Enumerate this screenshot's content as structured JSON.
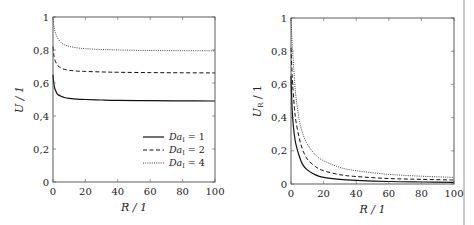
{
  "chart_data": [
    {
      "type": "line",
      "title": "",
      "xlabel": "R / 1",
      "ylabel": "U / 1",
      "xlim": [
        0,
        100
      ],
      "ylim": [
        0,
        1
      ],
      "xticks": [
        "0",
        "20",
        "40",
        "60",
        "80",
        "100"
      ],
      "yticks": [
        "0",
        "0,2",
        "0,4",
        "0,6",
        "0,8",
        "1"
      ],
      "grid": false,
      "legend_position": "bottom-right",
      "x": [
        0,
        0.5,
        1,
        2,
        3,
        5,
        7,
        10,
        15,
        20,
        30,
        40,
        60,
        80,
        100
      ],
      "series": [
        {
          "name": "Da_I = 1",
          "label_main": "Da",
          "label_sub": "I",
          "label_value": "= 1",
          "style": "solid",
          "values": [
            0.65,
            0.6,
            0.57,
            0.545,
            0.53,
            0.52,
            0.512,
            0.507,
            0.502,
            0.5,
            0.497,
            0.495,
            0.493,
            0.492,
            0.491
          ]
        },
        {
          "name": "Da_I = 2",
          "label_main": "Da",
          "label_sub": "I",
          "label_value": "= 2",
          "style": "dashed",
          "values": [
            0.82,
            0.77,
            0.745,
            0.72,
            0.705,
            0.69,
            0.683,
            0.677,
            0.672,
            0.67,
            0.667,
            0.665,
            0.663,
            0.662,
            0.661
          ]
        },
        {
          "name": "Da_I = 4",
          "label_main": "Da",
          "label_sub": "I",
          "label_value": "= 4",
          "style": "dotted",
          "values": [
            1.0,
            0.95,
            0.92,
            0.89,
            0.87,
            0.845,
            0.832,
            0.822,
            0.813,
            0.808,
            0.803,
            0.8,
            0.797,
            0.796,
            0.795
          ]
        }
      ]
    },
    {
      "type": "line",
      "title": "",
      "xlabel": "R / 1",
      "ylabel": "U_R / 1",
      "ylabel_main": "U",
      "ylabel_sub": "R",
      "ylabel_rest": " / 1",
      "xlim": [
        0,
        100
      ],
      "ylim": [
        0,
        1
      ],
      "xticks": [
        "0",
        "20",
        "40",
        "60",
        "80",
        "100"
      ],
      "yticks": [
        "0",
        "0,2",
        "0,4",
        "0,6",
        "0,8",
        "1"
      ],
      "grid": false,
      "x": [
        0,
        0.5,
        1,
        2,
        3,
        5,
        7,
        10,
        15,
        20,
        30,
        40,
        60,
        80,
        100
      ],
      "series": [
        {
          "name": "Da_I = 1",
          "style": "solid",
          "values": [
            0.65,
            0.5,
            0.4,
            0.3,
            0.24,
            0.17,
            0.12,
            0.085,
            0.055,
            0.04,
            0.028,
            0.022,
            0.015,
            0.012,
            0.01
          ]
        },
        {
          "name": "Da_I = 2",
          "style": "dashed",
          "values": [
            0.82,
            0.7,
            0.6,
            0.47,
            0.38,
            0.28,
            0.21,
            0.15,
            0.105,
            0.08,
            0.056,
            0.045,
            0.033,
            0.028,
            0.024
          ]
        },
        {
          "name": "Da_I = 4",
          "style": "dotted",
          "values": [
            1.0,
            0.9,
            0.8,
            0.65,
            0.53,
            0.39,
            0.31,
            0.24,
            0.175,
            0.14,
            0.1,
            0.08,
            0.058,
            0.047,
            0.04
          ]
        }
      ]
    }
  ]
}
